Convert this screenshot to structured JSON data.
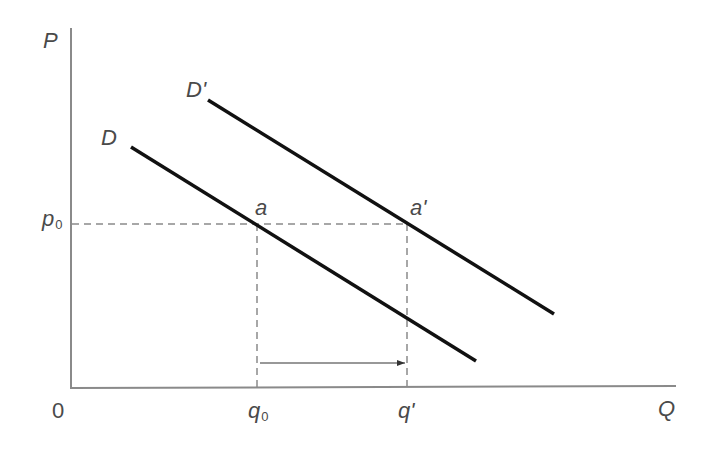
{
  "diagram": {
    "type": "economics-demand-shift",
    "axes": {
      "y_label": "P",
      "x_label": "Q",
      "origin_label": "0",
      "color": "#8a8a8a"
    },
    "curves": [
      {
        "id": "D",
        "label": "D",
        "color": "#111111"
      },
      {
        "id": "D_prime",
        "label": "D'",
        "color": "#111111"
      }
    ],
    "points": [
      {
        "id": "a",
        "label": "a"
      },
      {
        "id": "a_prime",
        "label": "a'"
      }
    ],
    "price_levels": [
      {
        "id": "p0",
        "base": "p",
        "subscript": "0"
      }
    ],
    "quantity_levels": [
      {
        "id": "q0",
        "base": "q",
        "subscript": "0"
      },
      {
        "id": "q_prime",
        "base": "q'"
      }
    ],
    "guide_line_color": "#8a8a8a",
    "shift_arrow": {
      "from": "q0",
      "to": "q'",
      "direction": "right"
    }
  }
}
